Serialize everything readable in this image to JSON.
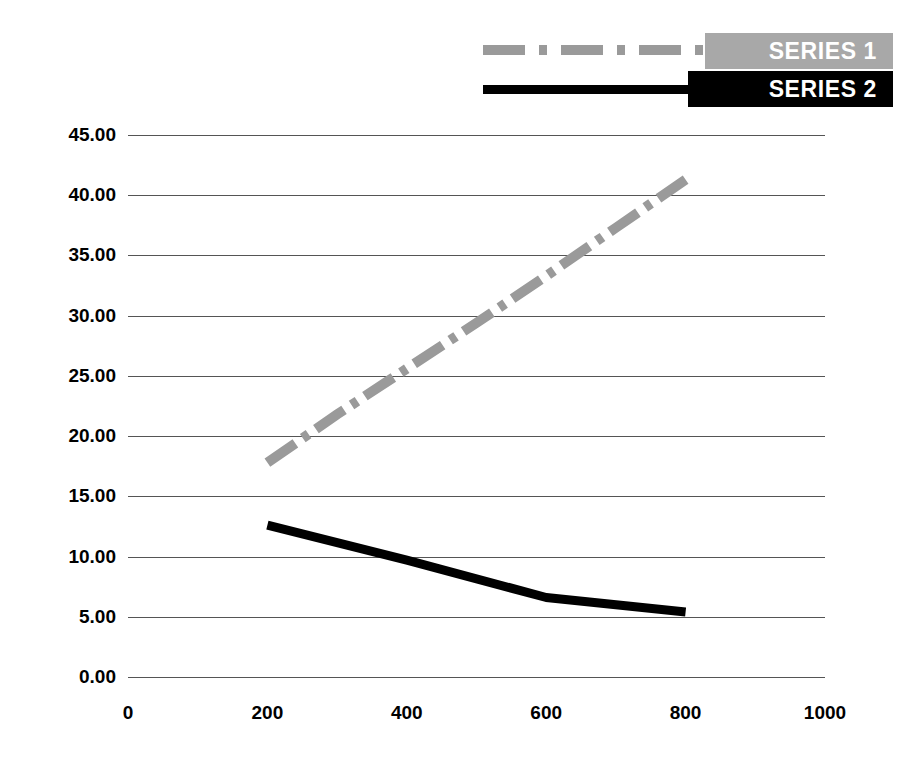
{
  "chart_data": {
    "type": "line",
    "title": "",
    "subtitle": "",
    "xlabel": "",
    "ylabel": "",
    "xlim": [
      0,
      1000
    ],
    "ylim": [
      0,
      45
    ],
    "xticks": [
      "0",
      "200",
      "400",
      "600",
      "800",
      "1000"
    ],
    "xtick_values": [
      0,
      200,
      400,
      600,
      800,
      1000
    ],
    "yticks": [
      "0.00",
      "5.00",
      "10.00",
      "15.00",
      "20.00",
      "25.00",
      "30.00",
      "35.00",
      "40.00",
      "45.00"
    ],
    "ytick_values": [
      0,
      5,
      10,
      15,
      20,
      25,
      30,
      35,
      40,
      45
    ],
    "grid": "horizontal",
    "legend_position": "top-right",
    "series": [
      {
        "name": "SERIES 1",
        "color": "#9a9a9a",
        "style": "dash-dot",
        "x": [
          200,
          300,
          400,
          500,
          600,
          700,
          800
        ],
        "values": [
          17.8,
          21.8,
          25.6,
          29.4,
          33.3,
          37.3,
          41.3
        ]
      },
      {
        "name": "SERIES 2",
        "color": "#000000",
        "style": "solid",
        "x": [
          200,
          400,
          600,
          800
        ],
        "values": [
          12.6,
          9.7,
          6.6,
          5.4
        ]
      }
    ]
  },
  "legend": {
    "items": [
      {
        "label": "SERIES 1",
        "color": "#a8a8a8",
        "text_color": "#ffffff"
      },
      {
        "label": "SERIES 2",
        "color": "#000000",
        "text_color": "#ffffff"
      }
    ]
  }
}
